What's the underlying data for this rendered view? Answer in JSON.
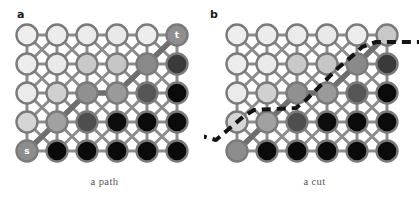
{
  "figure": {
    "width": 419,
    "height": 201,
    "background": "#ffffff",
    "edge_color": "#8c8c8c",
    "node_stroke": "#7a7a7a",
    "path_color": "#6e6e6e",
    "cut_color": "#141414"
  },
  "panels": [
    {
      "id": "a",
      "label": "a",
      "caption": "a path",
      "grid": {
        "cols": 6,
        "rows": 5,
        "x0": 27,
        "y0": 35,
        "dx": 30,
        "dy": 29,
        "radius": 10.5
      },
      "node_fills": [
        [
          "#eeeeee",
          "#ececec",
          "#ebebeb",
          "#e9e9e9",
          "#ededed",
          "#8f8f8f"
        ],
        [
          "#ededed",
          "#eaeaea",
          "#c9c9c9",
          "#c6c6c6",
          "#8a8a8a",
          "#3a3a3a"
        ],
        [
          "#ebebeb",
          "#d0d0d0",
          "#909090",
          "#9a9a9a",
          "#555555",
          "#0a0a0a"
        ],
        [
          "#d5d5d5",
          "#a1a1a1",
          "#4e4e4e",
          "#0d0d0d",
          "#0a0a0a",
          "#0a0a0a"
        ],
        [
          "#8d8d8d",
          "#0a0a0a",
          "#0a0a0a",
          "#0a0a0a",
          "#0a0a0a",
          "#0a0a0a"
        ]
      ],
      "terminals": [
        {
          "name": "source",
          "label": "s",
          "col": 0,
          "row": 4
        },
        {
          "name": "sink",
          "label": "t",
          "col": 5,
          "row": 0
        }
      ],
      "path_nodes": [
        {
          "col": 0,
          "row": 4
        },
        {
          "col": 1,
          "row": 3
        },
        {
          "col": 2,
          "row": 2
        },
        {
          "col": 3,
          "row": 2
        },
        {
          "col": 4,
          "row": 1
        },
        {
          "col": 5,
          "row": 0
        }
      ]
    },
    {
      "id": "b",
      "label": "b",
      "caption": "a cut",
      "grid": {
        "cols": 6,
        "rows": 5,
        "x0": 27,
        "y0": 35,
        "dx": 30,
        "dy": 29,
        "radius": 10.5
      },
      "node_fills": [
        [
          "#eeeeee",
          "#ececec",
          "#ebebeb",
          "#e9e9e9",
          "#ededed",
          "#c8c8c8"
        ],
        [
          "#ededed",
          "#eaeaea",
          "#c9c9c9",
          "#c6c6c6",
          "#8a8a8a",
          "#3a3a3a"
        ],
        [
          "#ebebeb",
          "#d0d0d0",
          "#909090",
          "#9a9a9a",
          "#555555",
          "#0a0a0a"
        ],
        [
          "#d5d5d5",
          "#a1a1a1",
          "#4e4e4e",
          "#0d0d0d",
          "#0a0a0a",
          "#0a0a0a"
        ],
        [
          "#8d8d8d",
          "#0a0a0a",
          "#0a0a0a",
          "#0a0a0a",
          "#0a0a0a",
          "#0a0a0a"
        ]
      ],
      "terminals": [],
      "path_nodes": [
        {
          "col": 0,
          "row": 4
        },
        {
          "col": 1,
          "row": 3
        },
        {
          "col": 2,
          "row": 2
        },
        {
          "col": 3,
          "row": 2
        },
        {
          "col": 4,
          "row": 1
        },
        {
          "col": 5,
          "row": 0
        }
      ],
      "cut_polyline": "-12,135 6,140 20,128 34,116 44,110 64,109 86,108 96,100 112,84 128,68 140,58 152,47 166,42 186,42 210,42"
    }
  ]
}
